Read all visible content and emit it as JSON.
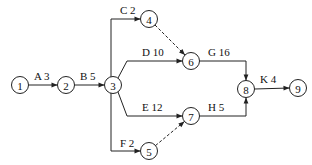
{
  "diagram": {
    "type": "activity-on-arrow network",
    "nodes": [
      {
        "id": "1",
        "label": "1"
      },
      {
        "id": "2",
        "label": "2"
      },
      {
        "id": "3",
        "label": "3"
      },
      {
        "id": "4",
        "label": "4"
      },
      {
        "id": "5",
        "label": "5"
      },
      {
        "id": "6",
        "label": "6"
      },
      {
        "id": "7",
        "label": "7"
      },
      {
        "id": "8",
        "label": "8"
      },
      {
        "id": "9",
        "label": "9"
      }
    ],
    "activities": [
      {
        "name": "A",
        "duration": 3,
        "from": "1",
        "to": "2",
        "label": "A  3"
      },
      {
        "name": "B",
        "duration": 5,
        "from": "2",
        "to": "3",
        "label": "B  5"
      },
      {
        "name": "C",
        "duration": 2,
        "from": "3",
        "to": "4",
        "label": "C  2"
      },
      {
        "name": "D",
        "duration": 10,
        "from": "3",
        "to": "6",
        "label": "D  10"
      },
      {
        "name": "E",
        "duration": 12,
        "from": "3",
        "to": "7",
        "label": "E  12"
      },
      {
        "name": "F",
        "duration": 2,
        "from": "3",
        "to": "5",
        "label": "F  2"
      },
      {
        "name": "G",
        "duration": 16,
        "from": "6",
        "to": "8",
        "label": "G  16"
      },
      {
        "name": "H",
        "duration": 5,
        "from": "7",
        "to": "8",
        "label": "H  5"
      },
      {
        "name": "K",
        "duration": 4,
        "from": "8",
        "to": "9",
        "label": "K  4"
      }
    ],
    "dummies": [
      {
        "from": "4",
        "to": "6"
      },
      {
        "from": "5",
        "to": "7"
      }
    ]
  }
}
